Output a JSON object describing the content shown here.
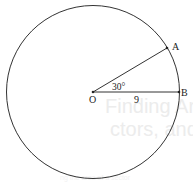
{
  "diagram": {
    "type": "circle-sector",
    "center": {
      "label": "O",
      "x": 93,
      "y": 92
    },
    "radius_px": 86,
    "points": [
      {
        "label": "A",
        "x": 167,
        "y": 49
      },
      {
        "label": "B",
        "x": 179,
        "y": 92
      }
    ],
    "segments": [
      {
        "from": "O",
        "to": "A"
      },
      {
        "from": "O",
        "to": "B",
        "length_label": "9"
      }
    ],
    "angle": {
      "vertex": "O",
      "between": [
        "A",
        "B"
      ],
      "label": "30°"
    },
    "stroke_color": "#333333"
  },
  "background_text": {
    "line1": "Finding Area and",
    "line2": "ctors, and Segme",
    "line3": "",
    "line4": "",
    "line5": "ng the area of a sector"
  }
}
